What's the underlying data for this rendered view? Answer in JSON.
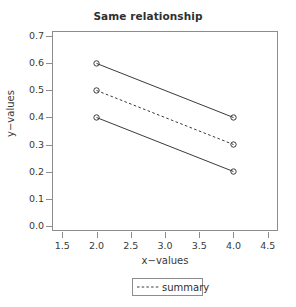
{
  "chart_data": {
    "type": "line",
    "title": "Same relationship",
    "xlabel": "x−values",
    "ylabel": "y−values",
    "xlim": [
      1.35,
      4.65
    ],
    "ylim": [
      -0.02,
      0.72
    ],
    "grid": false,
    "legend_position": "bottom-center",
    "x": [
      2.0,
      4.0
    ],
    "xticks": [
      "1.5",
      "2.0",
      "2.5",
      "3.0",
      "3.5",
      "4.0",
      "4.5"
    ],
    "xtick_values": [
      1.5,
      2.0,
      2.5,
      3.0,
      3.5,
      4.0,
      4.5
    ],
    "yticks": [
      "0.0",
      "0.1",
      "0.2",
      "0.3",
      "0.4",
      "0.5",
      "0.6",
      "0.7"
    ],
    "ytick_values": [
      0.0,
      0.1,
      0.2,
      0.3,
      0.4,
      0.5,
      0.6,
      0.7
    ],
    "marker": "open-circle",
    "line_color": "#3a3a3a",
    "panel_border_color": "#8d8d8d",
    "series": [
      {
        "name": "upper",
        "values": [
          0.6,
          0.4
        ],
        "style": "solid",
        "in_legend": false
      },
      {
        "name": "summary",
        "values": [
          0.5,
          0.3
        ],
        "style": "dashed",
        "in_legend": true
      },
      {
        "name": "lower",
        "values": [
          0.4,
          0.2
        ],
        "style": "solid",
        "in_legend": false
      }
    ],
    "legend": [
      {
        "label": "summary",
        "style": "dashed"
      }
    ]
  }
}
